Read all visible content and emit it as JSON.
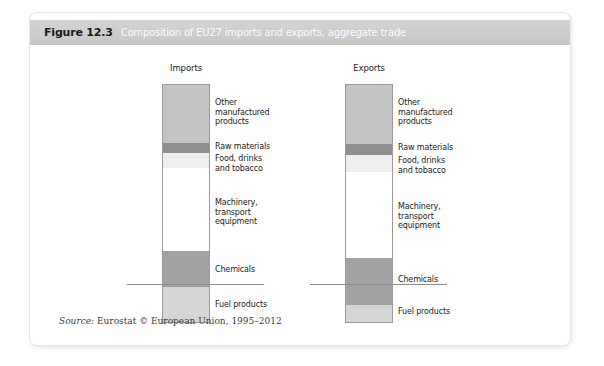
{
  "figure": {
    "number": "Figure 12.3",
    "title": "Composition of EU27 imports and exports, aggregate trade",
    "source_label": "Source:",
    "source_text": "Eurostat © European Union, 1995–2012"
  },
  "colors": {
    "header_band": "#cdcdcd",
    "other_manufactured": "#c4c4c4",
    "raw_materials": "#8e8e8e",
    "food_drinks": "#eeeeee",
    "machinery": "#ffffff",
    "chemicals": "#a3a3a3",
    "fuel_products": "#d6d6d6",
    "outline": "#9a9a9a",
    "text": "#1b1b1b"
  },
  "chart_data": {
    "type": "bar",
    "title": "Composition of EU27 imports and exports, aggregate trade",
    "xlabel": "",
    "ylabel": "",
    "stacked": true,
    "grid": false,
    "legend": "inline-labels-right-of-bar",
    "categories": [
      "Imports",
      "Exports"
    ],
    "segment_order_top_to_bottom": [
      "Other manufactured products",
      "Raw materials",
      "Food, drinks and tobacco",
      "Machinery, transport equipment",
      "Chemicals",
      "Fuel products"
    ],
    "series": [
      {
        "name": "Other manufactured products",
        "color": "#c4c4c4",
        "values": [
          24.7,
          25.1
        ]
      },
      {
        "name": "Raw materials",
        "color": "#8e8e8e",
        "values": [
          4.2,
          4.6
        ]
      },
      {
        "name": "Food, drinks and tobacco",
        "color": "#eeeeee",
        "values": [
          6.3,
          7.1
        ]
      },
      {
        "name": "Machinery, transport equipment",
        "color": "#ffffff",
        "values": [
          34.7,
          36.0
        ]
      },
      {
        "name": "Chemicals",
        "color": "#a3a3a3",
        "values": [
          15.1,
          19.7
        ]
      },
      {
        "name": "Fuel products",
        "color": "#d6d6d6",
        "values": [
          15.0,
          7.5
        ]
      }
    ]
  },
  "charts": [
    {
      "key": "imports",
      "heading": "Imports",
      "segments": [
        {
          "label": "Other\nmanufactured\nproducts",
          "fill": "#c4c4c4",
          "top": 0,
          "height": 59,
          "label_top": 14
        },
        {
          "label": "Raw materials",
          "fill": "#8e8e8e",
          "top": 59,
          "height": 10,
          "label_top": 58
        },
        {
          "label": "Food, drinks\nand tobacco",
          "fill": "#eeeeee",
          "top": 69,
          "height": 15,
          "label_top": 70
        },
        {
          "label": "Machinery,\ntransport\nequipment",
          "fill": "#ffffff",
          "top": 84,
          "height": 83,
          "label_top": 114
        },
        {
          "label": "Chemicals",
          "fill": "#a3a3a3",
          "top": 167,
          "height": 36,
          "label_top": 181
        },
        {
          "label": "Fuel products",
          "fill": "#d6d6d6",
          "top": 203,
          "height": 36,
          "label_top": 216
        }
      ]
    },
    {
      "key": "exports",
      "heading": "Exports",
      "segments": [
        {
          "label": "Other\nmanufactured\nproducts",
          "fill": "#c4c4c4",
          "top": 0,
          "height": 60,
          "label_top": 14
        },
        {
          "label": "Raw materials",
          "fill": "#8e8e8e",
          "top": 60,
          "height": 11,
          "label_top": 59
        },
        {
          "label": "Food, drinks\nand tobacco",
          "fill": "#eeeeee",
          "top": 71,
          "height": 17,
          "label_top": 72
        },
        {
          "label": "Machinery,\ntransport\nequipment",
          "fill": "#ffffff",
          "top": 88,
          "height": 86,
          "label_top": 118
        },
        {
          "label": "Chemicals",
          "fill": "#a3a3a3",
          "top": 174,
          "height": 47,
          "label_top": 191
        },
        {
          "label": "Fuel products",
          "fill": "#d6d6d6",
          "top": 221,
          "height": 18,
          "label_top": 223
        }
      ]
    }
  ]
}
